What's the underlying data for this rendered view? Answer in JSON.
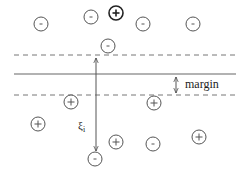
{
  "diagram": {
    "lines": {
      "upper_margin": {
        "y": 55,
        "x1": 14,
        "x2": 236,
        "style": "dashed"
      },
      "decision_boundary": {
        "y": 74,
        "x1": 14,
        "x2": 236,
        "style": "solid"
      },
      "lower_margin": {
        "y": 95,
        "x1": 14,
        "x2": 236,
        "style": "dashed"
      }
    },
    "labels": {
      "margin": "margin",
      "slack": "ξ",
      "slack_subscript": "i"
    },
    "points": [
      {
        "x": 41,
        "y": 24,
        "sign": "-",
        "bold": false
      },
      {
        "x": 91,
        "y": 17,
        "sign": "-",
        "bold": false
      },
      {
        "x": 116,
        "y": 13,
        "sign": "+",
        "bold": true
      },
      {
        "x": 143,
        "y": 24,
        "sign": "-",
        "bold": false
      },
      {
        "x": 193,
        "y": 24,
        "sign": "-",
        "bold": false
      },
      {
        "x": 108,
        "y": 46,
        "sign": "-",
        "bold": false
      },
      {
        "x": 71,
        "y": 102,
        "sign": "+",
        "bold": false
      },
      {
        "x": 154,
        "y": 103,
        "sign": "+",
        "bold": false
      },
      {
        "x": 38,
        "y": 124,
        "sign": "+",
        "bold": false
      },
      {
        "x": 116,
        "y": 142,
        "sign": "+",
        "bold": false
      },
      {
        "x": 153,
        "y": 144,
        "sign": "-",
        "bold": false
      },
      {
        "x": 199,
        "y": 137,
        "sign": "+",
        "bold": false
      },
      {
        "x": 95,
        "y": 159,
        "sign": "-",
        "bold": false
      }
    ],
    "colors": {
      "stroke": "#555555",
      "bold_stroke": "#222222",
      "line": "#666666"
    }
  }
}
